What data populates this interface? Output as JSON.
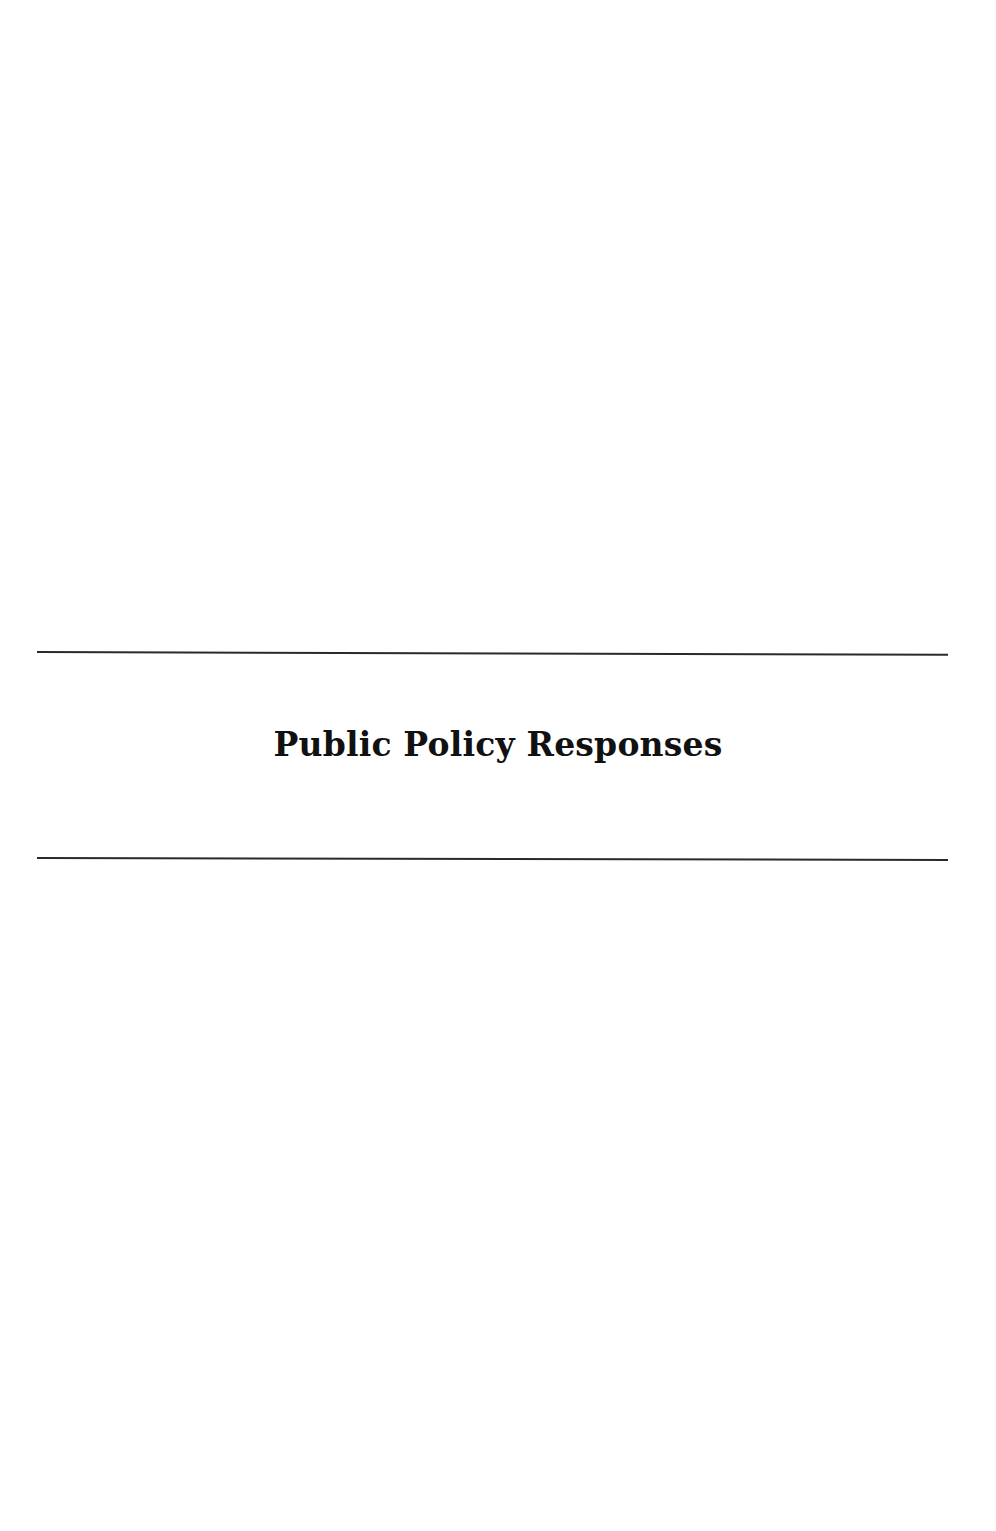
{
  "page": {
    "section_title": "Public Policy Responses",
    "rules": [
      {
        "position": "above-title"
      },
      {
        "position": "below-title"
      }
    ],
    "colors": {
      "background": "#ffffff",
      "text": "#111111",
      "rule": "#2a2a2a"
    }
  }
}
